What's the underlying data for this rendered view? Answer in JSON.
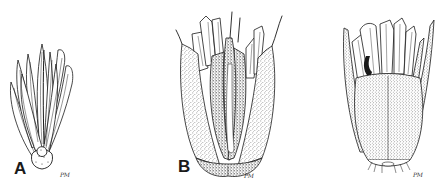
{
  "figure": {
    "type": "botanical-illustration",
    "style": "pen-and-ink stipple",
    "background": "#ffffff",
    "ink": "#1a1a1a",
    "panels": [
      {
        "id": "A",
        "label": "A",
        "signature": "PM",
        "subject": "open involucre with bracts, glabrous"
      },
      {
        "id": "B",
        "label": "B",
        "signature": "PM",
        "subject": "stippled involucre with bracts and awn tips"
      },
      {
        "id": "C",
        "label": "",
        "signature": "PM",
        "subject": "densely stippled involucre with fringed base"
      }
    ]
  }
}
